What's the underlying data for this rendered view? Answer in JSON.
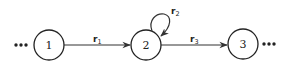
{
  "diagram": {
    "type": "state-transition-chain",
    "colors": {
      "stroke": "#222222",
      "background": "#ffffff"
    },
    "left_ellipsis": "...",
    "right_ellipsis": "...",
    "nodes": [
      {
        "id": "1",
        "label": "1"
      },
      {
        "id": "2",
        "label": "2"
      },
      {
        "id": "3",
        "label": "3"
      }
    ],
    "edges": [
      {
        "from": "1",
        "to": "2",
        "label_base": "r",
        "label_sub": "1"
      },
      {
        "from": "2",
        "to": "2",
        "label_base": "r",
        "label_sub": "2",
        "self_loop": true
      },
      {
        "from": "2",
        "to": "3",
        "label_base": "r",
        "label_sub": "3"
      }
    ]
  }
}
